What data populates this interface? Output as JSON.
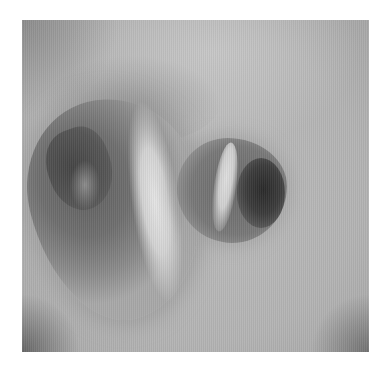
{
  "image": {
    "kind": "grayscale endoscopic photograph",
    "subject": "airway bifurcation with two lumens",
    "colors": {
      "background": "#ffffff",
      "wall": "#b5b5b5",
      "carina_highlight": "#e0e0e0",
      "lumen_dark": "#2e2e2e"
    }
  }
}
